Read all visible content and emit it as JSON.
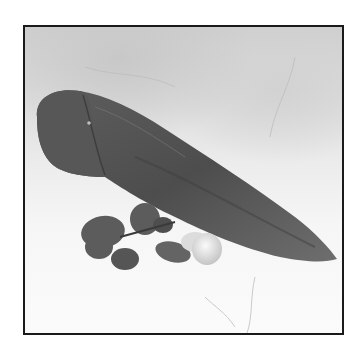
{
  "image": {
    "subject": "raw meat tenderloin on marble surface with herb garnish",
    "colors": {
      "border": "#1a1a1a",
      "marble_top": "#cfcfcf",
      "marble_bottom": "#fbfbfb",
      "meat_dark": "#4a4a4a",
      "meat_mid": "#6a6a6a",
      "herb": "#5a5a5a",
      "garlic": "#e8e8e8"
    }
  }
}
